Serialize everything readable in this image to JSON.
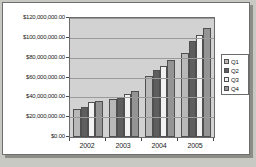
{
  "chart_data": {
    "type": "bar",
    "title": "",
    "xlabel": "",
    "ylabel": "",
    "categories": [
      "2002",
      "2003",
      "2004",
      "2005"
    ],
    "series": [
      {
        "name": "Q1",
        "values": [
          28000000,
          38000000,
          62000000,
          85000000
        ],
        "color": "#b8b8b8"
      },
      {
        "name": "Q2",
        "values": [
          30000000,
          39000000,
          68000000,
          97000000
        ],
        "color": "#5e5e5e"
      },
      {
        "name": "Q3",
        "values": [
          35000000,
          43000000,
          72000000,
          103000000
        ],
        "color": "#f2f2f2"
      },
      {
        "name": "Q4",
        "values": [
          36000000,
          46000000,
          78000000,
          110000000
        ],
        "color": "#949494"
      }
    ],
    "ylim": [
      0,
      120000000
    ],
    "ytick_values": [
      0,
      20000000,
      40000000,
      60000000,
      80000000,
      100000000,
      120000000
    ],
    "ytick_labels": [
      "$0.00",
      "$20,000,000.00",
      "$40,000,000.00",
      "$60,000,000.00",
      "$80,000,000.00",
      "$100,000,000.00",
      "$120,000,000.00"
    ],
    "xtick_labels": [
      "2002",
      "2003",
      "2004",
      "2005"
    ],
    "grid": true,
    "legend_position": "right",
    "legend_entries": [
      "Q1",
      "Q2",
      "Q3",
      "Q4"
    ],
    "plot_background": "#d2d2d2",
    "chart_background": "#ffffff"
  }
}
